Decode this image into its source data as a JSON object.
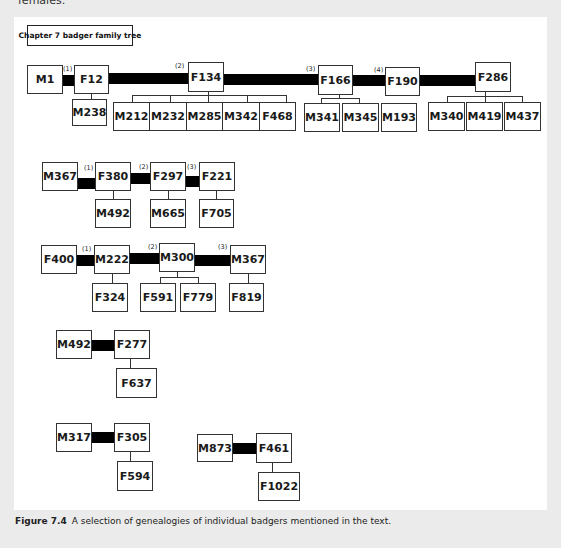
{
  "header": {
    "partial_text": "females."
  },
  "title_box": {
    "label": "Chapter 7 badger family tree"
  },
  "caption": {
    "label": "Figure 7.4",
    "text": "A selection of genealogies of individual badgers mentioned in the text."
  },
  "trees": [
    {
      "id": "tree1",
      "chain": [
        "M1",
        "F12",
        "F134",
        "F166",
        "F190",
        "F286"
      ],
      "partnership_numbers": [
        "(1)",
        "(2)",
        "(3)",
        "(4)"
      ],
      "offspring": {
        "F12": [
          "M238"
        ],
        "F134": [
          "M212",
          "M232",
          "M285",
          "M342",
          "F468"
        ],
        "F166": [
          "M341",
          "M345"
        ],
        "F190": [
          "M193"
        ],
        "F286": [
          "M340",
          "M419",
          "M437"
        ]
      }
    },
    {
      "id": "tree2",
      "chain": [
        "M367",
        "F380",
        "F297",
        "F221"
      ],
      "partnership_numbers": [
        "(1)",
        "(2)",
        "(3)"
      ],
      "offspring": {
        "F380": [
          "M492"
        ],
        "F297": [
          "M665"
        ],
        "F221": [
          "F705"
        ]
      }
    },
    {
      "id": "tree3",
      "chain": [
        "F400",
        "M222",
        "M300",
        "M367"
      ],
      "partnership_numbers": [
        "(1)",
        "(2)",
        "(3)"
      ],
      "offspring": {
        "M222": [
          "F324"
        ],
        "M300": [
          "F591",
          "F779"
        ],
        "M367": [
          "F819"
        ]
      }
    },
    {
      "id": "tree4",
      "chain": [
        "M492",
        "F277"
      ],
      "partnership_numbers": [],
      "offspring": {
        "F277": [
          "F637"
        ]
      }
    },
    {
      "id": "tree5",
      "chain": [
        "M317",
        "F305"
      ],
      "partnership_numbers": [],
      "offspring": {
        "F305": [
          "F594"
        ]
      }
    },
    {
      "id": "tree6",
      "chain": [
        "M873",
        "F461"
      ],
      "partnership_numbers": [],
      "offspring": {
        "F461": [
          "F1022"
        ]
      }
    }
  ]
}
